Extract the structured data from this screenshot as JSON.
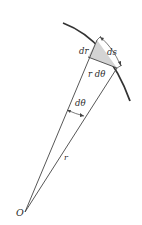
{
  "figure": {
    "type": "polar-coordinate-arc-element-diagram",
    "colors": {
      "background": "#ffffff",
      "arc": "#333333",
      "lines": "#444444",
      "shaded_region": "#d4d4d4"
    },
    "labels": {
      "origin": "O",
      "radius": "r",
      "angle": "dθ",
      "radial_increment": "dr",
      "arc_length": "ds",
      "arc_chord": "r dθ"
    }
  }
}
